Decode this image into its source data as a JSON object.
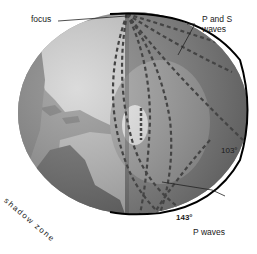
{
  "diagram": {
    "labels": {
      "focus": "focus",
      "p_and_s_line1": "P and S",
      "p_and_s_line2": "waves",
      "angle_103": "103°",
      "angle_143": "143°",
      "p_waves": "P waves",
      "shadow_zone": "shadow zone"
    },
    "colors": {
      "background": "#ffffff",
      "ocean": "#8a8a8a",
      "land": "#c8c8c8",
      "mantle": "#7d7d7d",
      "outer_core": "#9a9a9a",
      "inner_core": "#e6e6e6",
      "wave_dash": "#4a4a4a",
      "outline": "#000000"
    }
  }
}
